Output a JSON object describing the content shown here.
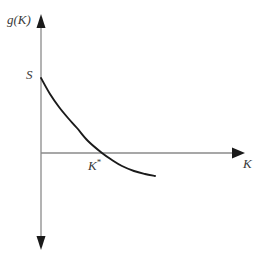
{
  "figure": {
    "title": "",
    "background_color": "#ffffff"
  },
  "chart_data": {
    "type": "line",
    "title": "",
    "xlabel": "K",
    "ylabel": "g(K)",
    "grid": false,
    "legend": null,
    "annotations": [
      {
        "name": "y-intercept",
        "label": "S",
        "x": 0,
        "y": 1.0
      },
      {
        "name": "x-intercept",
        "label": "K*",
        "x": 0.3,
        "y": 0
      }
    ],
    "axes": {
      "x_axis": {
        "label": "K",
        "arrow": "right",
        "origin_px": [
          41,
          153
        ],
        "end_px": [
          243,
          153
        ],
        "color": "#8a8a8a"
      },
      "y_axis": {
        "label": "g(K)",
        "arrow": "both",
        "top_px": [
          41,
          15
        ],
        "bottom_px": [
          41,
          249
        ],
        "color": "#8a8a8a"
      }
    },
    "series": [
      {
        "name": "g(K)",
        "color": "#1a1a1a",
        "x": [
          0.0,
          0.05,
          0.1,
          0.15,
          0.2,
          0.25,
          0.3,
          0.35,
          0.4,
          0.45,
          0.5,
          0.55
        ],
        "y": [
          1.0,
          0.78,
          0.6,
          0.45,
          0.32,
          0.15,
          0.0,
          -0.09,
          -0.17,
          -0.24,
          -0.28,
          -0.3
        ],
        "points_px": [
          [
            41,
            78
          ],
          [
            50,
            94
          ],
          [
            59,
            107
          ],
          [
            68,
            118
          ],
          [
            77,
            128
          ],
          [
            88,
            141
          ],
          [
            102,
            153
          ],
          [
            112,
            160
          ],
          [
            122,
            166
          ],
          [
            134,
            171
          ],
          [
            145,
            174
          ],
          [
            155,
            176
          ]
        ]
      }
    ],
    "xlim": [
      0,
      1
    ],
    "ylim": [
      -0.75,
      1.35
    ]
  },
  "labels": {
    "y_axis_label": "g(K)",
    "x_axis_label": "K",
    "y_intercept_label": "S",
    "x_intercept_label": "K",
    "x_intercept_star": "*"
  },
  "colors": {
    "curve": "#1a1a1a",
    "axis": "#8a8a8a",
    "arrow": "#1a1a1a",
    "text": "#3a3a3a",
    "background": "#ffffff"
  }
}
